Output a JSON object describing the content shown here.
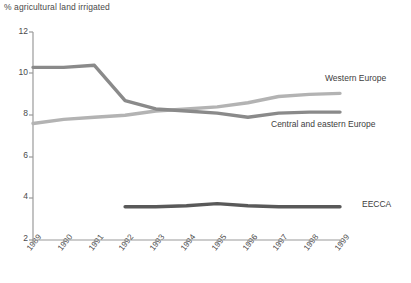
{
  "chart_data": {
    "type": "line",
    "title": "% agricultural land irrigated",
    "xlabel": "",
    "ylabel": "% agricultural land irrigated",
    "x": [
      1989,
      1990,
      1991,
      1992,
      1993,
      1994,
      1995,
      1996,
      1997,
      1998,
      1999
    ],
    "categories": [
      "1989",
      "1990",
      "1991",
      "1992",
      "1993",
      "1994",
      "1995",
      "1996",
      "1997",
      "1998",
      "1999"
    ],
    "xlim": [
      1989,
      1999
    ],
    "ylim": [
      2,
      12
    ],
    "yticks": [
      2,
      4,
      6,
      8,
      10,
      12
    ],
    "ytick_labels": [
      "2",
      "4",
      "6",
      "8",
      "10",
      "12"
    ],
    "grid": false,
    "legend_position": "right-inline",
    "series": [
      {
        "name": "Western Europe",
        "color": "#b3b3b3",
        "values": [
          7.6,
          7.8,
          7.9,
          8.0,
          8.2,
          8.3,
          8.4,
          8.6,
          8.9,
          9.0,
          9.05
        ]
      },
      {
        "name": "Central and eastern Europe",
        "color": "#8a8a8a",
        "values": [
          10.3,
          10.3,
          10.4,
          8.7,
          8.3,
          8.2,
          8.1,
          7.9,
          8.1,
          8.15,
          8.15
        ]
      },
      {
        "name": "EECCA",
        "color": "#595959",
        "values": [
          null,
          null,
          null,
          3.6,
          3.6,
          3.65,
          3.75,
          3.65,
          3.6,
          3.6,
          3.6
        ]
      }
    ]
  },
  "axis": {
    "title": "% agricultural land irrigated",
    "y_ticks": [
      "12",
      "10",
      "8",
      "6",
      "4",
      "2"
    ],
    "x_ticks": [
      "1989",
      "1990",
      "1991",
      "1992",
      "1993",
      "1994",
      "1995",
      "1996",
      "1997",
      "1998",
      "1999"
    ]
  },
  "legend": {
    "western_europe": "Western Europe",
    "central_eastern_europe": "Central and eastern Europe",
    "eecca": "EECCA"
  },
  "colors": {
    "western_europe": "#b3b3b3",
    "central_eastern_europe": "#8a8a8a",
    "eecca": "#595959",
    "axis": "#8f8f8f",
    "text": "#4a4a4a",
    "background": "#ffffff"
  }
}
